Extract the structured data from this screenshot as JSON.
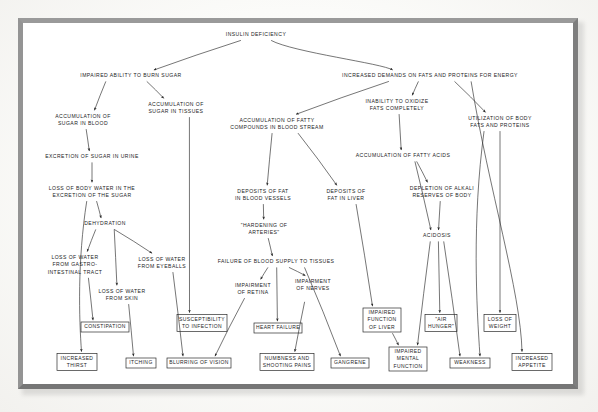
{
  "diagram": {
    "style": {
      "frame_color": "#8f8f8f",
      "paper_color": "#ffffff",
      "ink_color": "#232323"
    },
    "root": {
      "id": "insulin_deficiency",
      "label": "INSULIN DEFICIENCY",
      "x": 256,
      "y": 35
    },
    "nodes": [
      {
        "id": "impaired_burn",
        "lines": [
          "IMPAIRED ABILITY TO BURN SUGAR"
        ],
        "x": 131,
        "y": 76
      },
      {
        "id": "increased_demands",
        "lines": [
          "INCREASED DEMANDS ON FATS AND PROTEINS FOR ENERGY"
        ],
        "x": 430,
        "y": 76
      },
      {
        "id": "accum_sugar_blood",
        "lines": [
          "ACCUMULATION OF",
          "SUGAR IN BLOOD"
        ],
        "x": 83,
        "y": 120
      },
      {
        "id": "accum_sugar_tissues",
        "lines": [
          "ACCUMULATION OF",
          "SUGAR IN TISSUES"
        ],
        "x": 176,
        "y": 108
      },
      {
        "id": "accum_fatty_compounds",
        "lines": [
          "ACCUMULATION OF FATTY",
          "COMPOUNDS IN BLOOD STREAM"
        ],
        "x": 277,
        "y": 124
      },
      {
        "id": "inability_oxidize",
        "lines": [
          "INABILITY TO OXIDIZE",
          "FATS COMPLETELY"
        ],
        "x": 397,
        "y": 105
      },
      {
        "id": "utilization_body",
        "lines": [
          "UTILIZATION OF BODY",
          "FATS AND PROTEINS"
        ],
        "x": 500,
        "y": 122
      },
      {
        "id": "excretion_sugar_urine",
        "lines": [
          "EXCRETION OF SUGAR IN URINE"
        ],
        "x": 92,
        "y": 157
      },
      {
        "id": "accum_fatty_acids",
        "lines": [
          "ACCUMULATION OF FATTY ACIDS"
        ],
        "x": 403,
        "y": 156
      },
      {
        "id": "loss_body_water",
        "lines": [
          "LOSS OF BODY WATER IN THE",
          "EXCRETION OF THE SUGAR"
        ],
        "x": 92,
        "y": 192
      },
      {
        "id": "deposits_fat_vessels",
        "lines": [
          "DEPOSITS OF FAT",
          "IN BLOOD VESSELS"
        ],
        "x": 263,
        "y": 195
      },
      {
        "id": "deposits_fat_liver",
        "lines": [
          "DEPOSITS OF",
          "FAT IN LIVER"
        ],
        "x": 346,
        "y": 195
      },
      {
        "id": "depletion_alkali",
        "lines": [
          "DEPLETION OF ALKALI",
          "RESERVES OF BODY"
        ],
        "x": 442,
        "y": 192
      },
      {
        "id": "dehydration",
        "lines": [
          "DEHYDRATION"
        ],
        "x": 105,
        "y": 224
      },
      {
        "id": "hardening_arteries",
        "lines": [
          "\"HARDENING OF",
          "ARTERIES\""
        ],
        "x": 264,
        "y": 229
      },
      {
        "id": "loss_water_gi",
        "lines": [
          "LOSS OF WATER",
          "FROM GASTRO-",
          "INTESTINAL TRACT"
        ],
        "x": 75,
        "y": 265
      },
      {
        "id": "loss_water_eyeballs",
        "lines": [
          "LOSS OF WATER",
          "FROM EYEBALLS"
        ],
        "x": 162,
        "y": 263
      },
      {
        "id": "failure_blood_supply",
        "lines": [
          "FAILURE OF BLOOD SUPPLY TO TISSUES"
        ],
        "x": 276,
        "y": 262
      },
      {
        "id": "acidosis",
        "lines": [
          "ACIDOSIS"
        ],
        "x": 437,
        "y": 236
      },
      {
        "id": "loss_water_skin",
        "lines": [
          "LOSS OF WATER",
          "FROM SKIN"
        ],
        "x": 122,
        "y": 295
      },
      {
        "id": "impairment_retina",
        "lines": [
          "IMPAIRMENT",
          "OF RETINA"
        ],
        "x": 253,
        "y": 289
      },
      {
        "id": "impairment_nerves",
        "lines": [
          "IMPAIRMENT",
          "OF NERVES",
          ""
        ],
        "x": 313,
        "y": 289
      }
    ],
    "boxes": [
      {
        "id": "constipation",
        "lines": [
          "CONSTIPATION"
        ],
        "x": 105,
        "y": 327,
        "w": 48,
        "h": 10
      },
      {
        "id": "susceptibility",
        "lines": [
          "SUSCEPTIBILITY",
          "TO INFECTION"
        ],
        "x": 202,
        "y": 323,
        "w": 50,
        "h": 17
      },
      {
        "id": "heart_failure",
        "lines": [
          "HEART FAILURE"
        ],
        "x": 278,
        "y": 328,
        "w": 48,
        "h": 10
      },
      {
        "id": "impaired_liver",
        "lines": [
          "IMPAIRED",
          "FUNCTION",
          "OF LIVER"
        ],
        "x": 382,
        "y": 320,
        "w": 38,
        "h": 24
      },
      {
        "id": "air_hunger",
        "lines": [
          "\"AIR",
          "HUNGER\""
        ],
        "x": 441,
        "y": 323,
        "w": 32,
        "h": 17
      },
      {
        "id": "loss_weight",
        "lines": [
          "LOSS OF",
          "WEIGHT"
        ],
        "x": 500,
        "y": 323,
        "w": 32,
        "h": 17
      },
      {
        "id": "increased_thirst",
        "lines": [
          "INCREASED",
          "THIRST"
        ],
        "x": 77,
        "y": 362,
        "w": 40,
        "h": 17
      },
      {
        "id": "itching",
        "lines": [
          "ITCHING"
        ],
        "x": 141,
        "y": 363,
        "w": 30,
        "h": 10
      },
      {
        "id": "blurring_vision",
        "lines": [
          "BLURRING OF VISION"
        ],
        "x": 199,
        "y": 363,
        "w": 64,
        "h": 10
      },
      {
        "id": "numbness_shooting",
        "lines": [
          "NUMBNESS AND",
          "SHOOTING PAINS"
        ],
        "x": 287,
        "y": 362,
        "w": 54,
        "h": 17
      },
      {
        "id": "gangrene",
        "lines": [
          "GANGRENE"
        ],
        "x": 350,
        "y": 363,
        "w": 38,
        "h": 10
      },
      {
        "id": "impaired_mental",
        "lines": [
          "IMPAIRED",
          "MENTAL",
          "FUNCTION"
        ],
        "x": 408,
        "y": 359,
        "w": 38,
        "h": 24
      },
      {
        "id": "weakness",
        "lines": [
          "WEAKNESS"
        ],
        "x": 470,
        "y": 363,
        "w": 40,
        "h": 10
      },
      {
        "id": "increased_appetite",
        "lines": [
          "INCREASED",
          "APPETITE"
        ],
        "x": 532,
        "y": 362,
        "w": 40,
        "h": 17
      }
    ],
    "edges": [
      {
        "from": "insulin_deficiency",
        "to": "impaired_burn"
      },
      {
        "from": "insulin_deficiency",
        "to": "increased_demands"
      },
      {
        "from": "impaired_burn",
        "to": "accum_sugar_blood"
      },
      {
        "from": "impaired_burn",
        "to": "accum_sugar_tissues"
      },
      {
        "from": "increased_demands",
        "to": "accum_fatty_compounds"
      },
      {
        "from": "increased_demands",
        "to": "inability_oxidize"
      },
      {
        "from": "increased_demands",
        "to": "utilization_body"
      },
      {
        "from": "increased_demands",
        "to": "increased_appetite"
      },
      {
        "from": "accum_sugar_blood",
        "to": "excretion_sugar_urine"
      },
      {
        "from": "excretion_sugar_urine",
        "to": "loss_body_water"
      },
      {
        "from": "loss_body_water",
        "to": "increased_thirst"
      },
      {
        "from": "loss_body_water",
        "to": "dehydration"
      },
      {
        "from": "dehydration",
        "to": "loss_water_gi"
      },
      {
        "from": "dehydration",
        "to": "loss_water_skin"
      },
      {
        "from": "dehydration",
        "to": "loss_water_eyeballs"
      },
      {
        "from": "loss_water_gi",
        "to": "constipation"
      },
      {
        "from": "loss_water_skin",
        "to": "itching"
      },
      {
        "from": "loss_water_eyeballs",
        "to": "blurring_vision"
      },
      {
        "from": "accum_sugar_tissues",
        "to": "susceptibility"
      },
      {
        "from": "accum_fatty_compounds",
        "to": "deposits_fat_vessels"
      },
      {
        "from": "accum_fatty_compounds",
        "to": "deposits_fat_liver"
      },
      {
        "from": "deposits_fat_vessels",
        "to": "hardening_arteries"
      },
      {
        "from": "hardening_arteries",
        "to": "failure_blood_supply"
      },
      {
        "from": "failure_blood_supply",
        "to": "impairment_retina"
      },
      {
        "from": "failure_blood_supply",
        "to": "impairment_nerves"
      },
      {
        "from": "failure_blood_supply",
        "to": "heart_failure"
      },
      {
        "from": "failure_blood_supply",
        "to": "gangrene"
      },
      {
        "from": "impairment_retina",
        "to": "blurring_vision"
      },
      {
        "from": "impairment_nerves",
        "to": "numbness_shooting"
      },
      {
        "from": "deposits_fat_liver",
        "to": "impaired_liver"
      },
      {
        "from": "inability_oxidize",
        "to": "accum_fatty_acids"
      },
      {
        "from": "accum_fatty_acids",
        "to": "depletion_alkali"
      },
      {
        "from": "accum_fatty_acids",
        "to": "acidosis"
      },
      {
        "from": "depletion_alkali",
        "to": "acidosis"
      },
      {
        "from": "acidosis",
        "to": "air_hunger"
      },
      {
        "from": "acidosis",
        "to": "impaired_mental"
      },
      {
        "from": "acidosis",
        "to": "weakness"
      },
      {
        "from": "utilization_body",
        "to": "loss_weight"
      },
      {
        "from": "utilization_body",
        "to": "weakness"
      },
      {
        "from": "impaired_liver",
        "to": "impaired_mental"
      }
    ]
  }
}
